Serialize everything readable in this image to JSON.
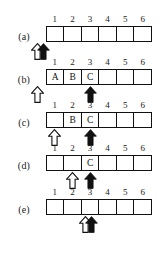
{
  "figure": {
    "cell_count": 6,
    "column_numbers": [
      "1",
      "2",
      "3",
      "4",
      "5",
      "6"
    ],
    "colors": {
      "ink": "#111111",
      "paper": "#ffffff",
      "read_pointer_fill": "#ffffff",
      "write_pointer_fill": "#111111"
    },
    "icons": {
      "white_arrow": "arrow-up-outline-icon",
      "black_arrow": "arrow-up-filled-icon"
    },
    "rows": [
      {
        "label": "(a)",
        "cells": [
          "",
          "",
          "",
          "",
          "",
          ""
        ],
        "white_arrow_position": "0",
        "black_arrow_position": "0.35"
      },
      {
        "label": "(b)",
        "cells": [
          "A",
          "B",
          "C",
          "",
          "",
          ""
        ],
        "white_arrow_position": "0",
        "black_arrow_position": "3"
      },
      {
        "label": "(c)",
        "cells": [
          "",
          "B",
          "C",
          "",
          "",
          ""
        ],
        "white_arrow_position": "1",
        "black_arrow_position": "3"
      },
      {
        "label": "(d)",
        "cells": [
          "",
          "",
          "C",
          "",
          "",
          ""
        ],
        "white_arrow_position": "2",
        "black_arrow_position": "3"
      },
      {
        "label": "(e)",
        "cells": [
          "",
          "",
          "",
          "",
          "",
          ""
        ],
        "white_arrow_position": "2.75",
        "black_arrow_position": "3.1"
      }
    ]
  }
}
